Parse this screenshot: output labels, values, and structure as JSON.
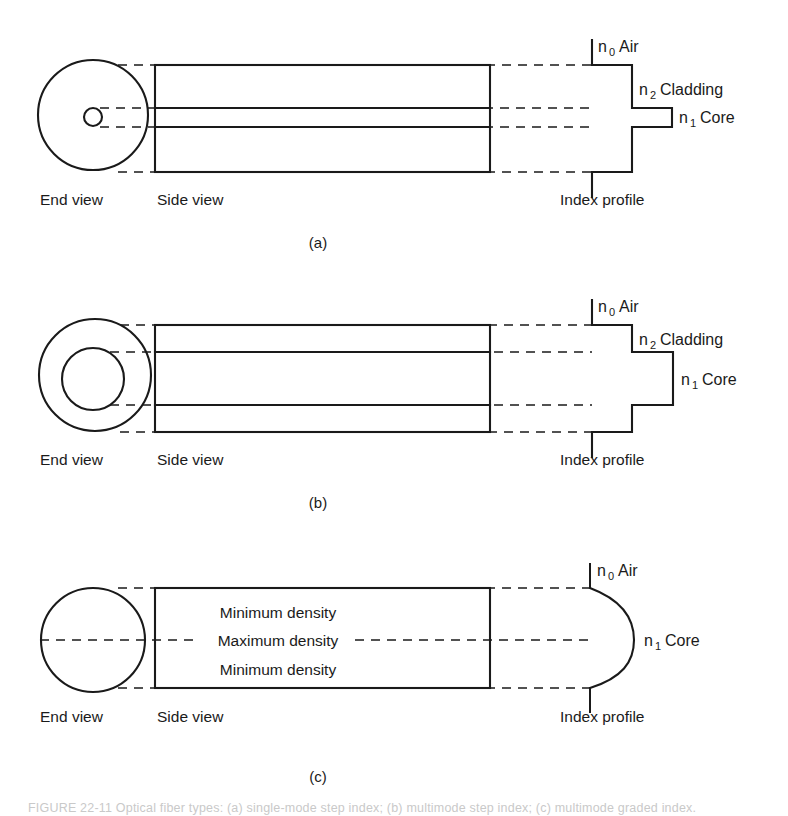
{
  "figure": {
    "background_color": "#ffffff",
    "line_color": "#1a1a1a",
    "caption": "FIGURE  22-11    Optical fiber types: (a) single-mode step index; (b) multimode step index; (c) multimode graded index."
  },
  "common_labels": {
    "end_view": "End view",
    "side_view": "Side view",
    "index_profile": "Index profile",
    "air": "Air",
    "cladding": "Cladding",
    "core": "Core",
    "n0": "n",
    "n0_sub": "0",
    "n1": "n",
    "n1_sub": "1",
    "n2": "n",
    "n2_sub": "2"
  },
  "panels": [
    {
      "id": "a",
      "label": "(a)",
      "fiber_type": "single-mode step index",
      "end_view": {
        "cladding_radius": 55,
        "core_radius": 9
      },
      "index_profile": {
        "type": "step",
        "regions": [
          {
            "name": "Air",
            "symbol": "n",
            "subscript": "0",
            "relative_index": 0.0
          },
          {
            "name": "Cladding",
            "symbol": "n",
            "subscript": "2",
            "relative_index": 0.72
          },
          {
            "name": "Core",
            "symbol": "n",
            "subscript": "1",
            "relative_index": 1.0
          }
        ]
      },
      "index_labels": [
        {
          "symbol": "n",
          "subscript": "0",
          "text": "Air"
        },
        {
          "symbol": "n",
          "subscript": "2",
          "text": "Cladding"
        },
        {
          "symbol": "n",
          "subscript": "1",
          "text": "Core"
        }
      ]
    },
    {
      "id": "b",
      "label": "(b)",
      "fiber_type": "multimode step index",
      "end_view": {
        "cladding_radius": 56,
        "core_radius": 31
      },
      "index_profile": {
        "type": "step",
        "regions": [
          {
            "name": "Air",
            "symbol": "n",
            "subscript": "0",
            "relative_index": 0.0
          },
          {
            "name": "Cladding",
            "symbol": "n",
            "subscript": "2",
            "relative_index": 0.72
          },
          {
            "name": "Core",
            "symbol": "n",
            "subscript": "1",
            "relative_index": 1.0
          }
        ]
      },
      "index_labels": [
        {
          "symbol": "n",
          "subscript": "0",
          "text": "Air"
        },
        {
          "symbol": "n",
          "subscript": "2",
          "text": "Cladding"
        },
        {
          "symbol": "n",
          "subscript": "1",
          "text": "Core"
        }
      ]
    },
    {
      "id": "c",
      "label": "(c)",
      "fiber_type": "multimode graded index",
      "end_view": {
        "cladding_radius": 52,
        "core_radius": 0
      },
      "side_view_annotations": [
        "Minimum density",
        "Maximum density",
        "Minimum density"
      ],
      "index_profile": {
        "type": "graded",
        "regions": [
          {
            "name": "Air",
            "symbol": "n",
            "subscript": "0",
            "relative_index": 0.0
          },
          {
            "name": "Core",
            "symbol": "n",
            "subscript": "1",
            "relative_index": 1.0
          }
        ]
      },
      "index_labels": [
        {
          "symbol": "n",
          "subscript": "0",
          "text": "Air"
        },
        {
          "symbol": "n",
          "subscript": "1",
          "text": "Core"
        }
      ]
    }
  ]
}
